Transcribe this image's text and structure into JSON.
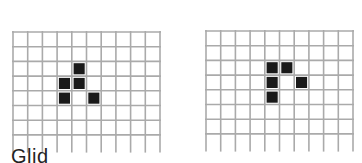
{
  "grids": [
    {
      "name": "glider-generation-1",
      "cols": 10,
      "rows": 8,
      "live_cells": [
        [
          4,
          2
        ],
        [
          3,
          3
        ],
        [
          4,
          3
        ],
        [
          3,
          4
        ],
        [
          5,
          4
        ]
      ]
    },
    {
      "name": "glider-generation-2",
      "cols": 10,
      "rows": 8,
      "live_cells": [
        [
          4,
          2
        ],
        [
          5,
          2
        ],
        [
          4,
          3
        ],
        [
          6,
          3
        ],
        [
          4,
          4
        ]
      ]
    }
  ],
  "colors": {
    "grid_line": "#aaaaaa",
    "live_cell": "#1a1a1a",
    "background": "#ffffff"
  },
  "caption": "Glid"
}
